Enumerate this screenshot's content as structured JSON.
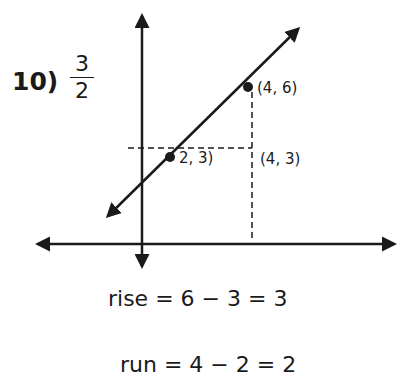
{
  "problem": {
    "number_label": "10)",
    "answer_numerator": "3",
    "answer_denominator": "2"
  },
  "graph": {
    "points": [
      {
        "label": "(4, 6)",
        "x": 4,
        "y": 6
      },
      {
        "label": "2, 3)",
        "x": 2,
        "y": 3
      }
    ],
    "corner_label": "(4, 3)"
  },
  "equations": {
    "rise": "rise = 6 − 3 = 3",
    "run": "run = 4 − 2 = 2"
  }
}
